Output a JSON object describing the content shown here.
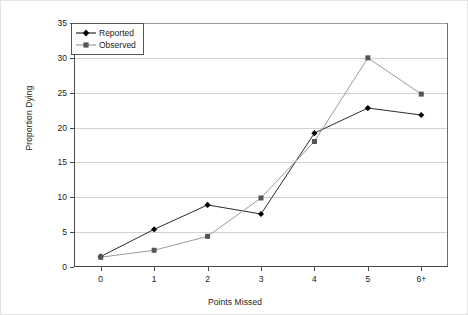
{
  "chart_data": {
    "type": "line",
    "title": "",
    "xlabel": "Points Missed",
    "ylabel": "Proportion Dying",
    "categories": [
      "0",
      "1",
      "2",
      "3",
      "4",
      "5",
      "6+"
    ],
    "ylim": [
      0,
      35
    ],
    "yticks": [
      0,
      5,
      10,
      15,
      20,
      25,
      30,
      35
    ],
    "grid": "horizontal",
    "legend_position": "top-left-inside",
    "series": [
      {
        "name": "Reported",
        "marker": "diamond",
        "color": "#000000",
        "values": [
          1.5,
          5.4,
          8.9,
          7.6,
          19.2,
          22.8,
          21.8
        ]
      },
      {
        "name": "Observed",
        "marker": "square",
        "color": "#808080",
        "values": [
          1.4,
          2.4,
          4.4,
          9.9,
          18.0,
          30.0,
          24.8
        ]
      }
    ]
  }
}
